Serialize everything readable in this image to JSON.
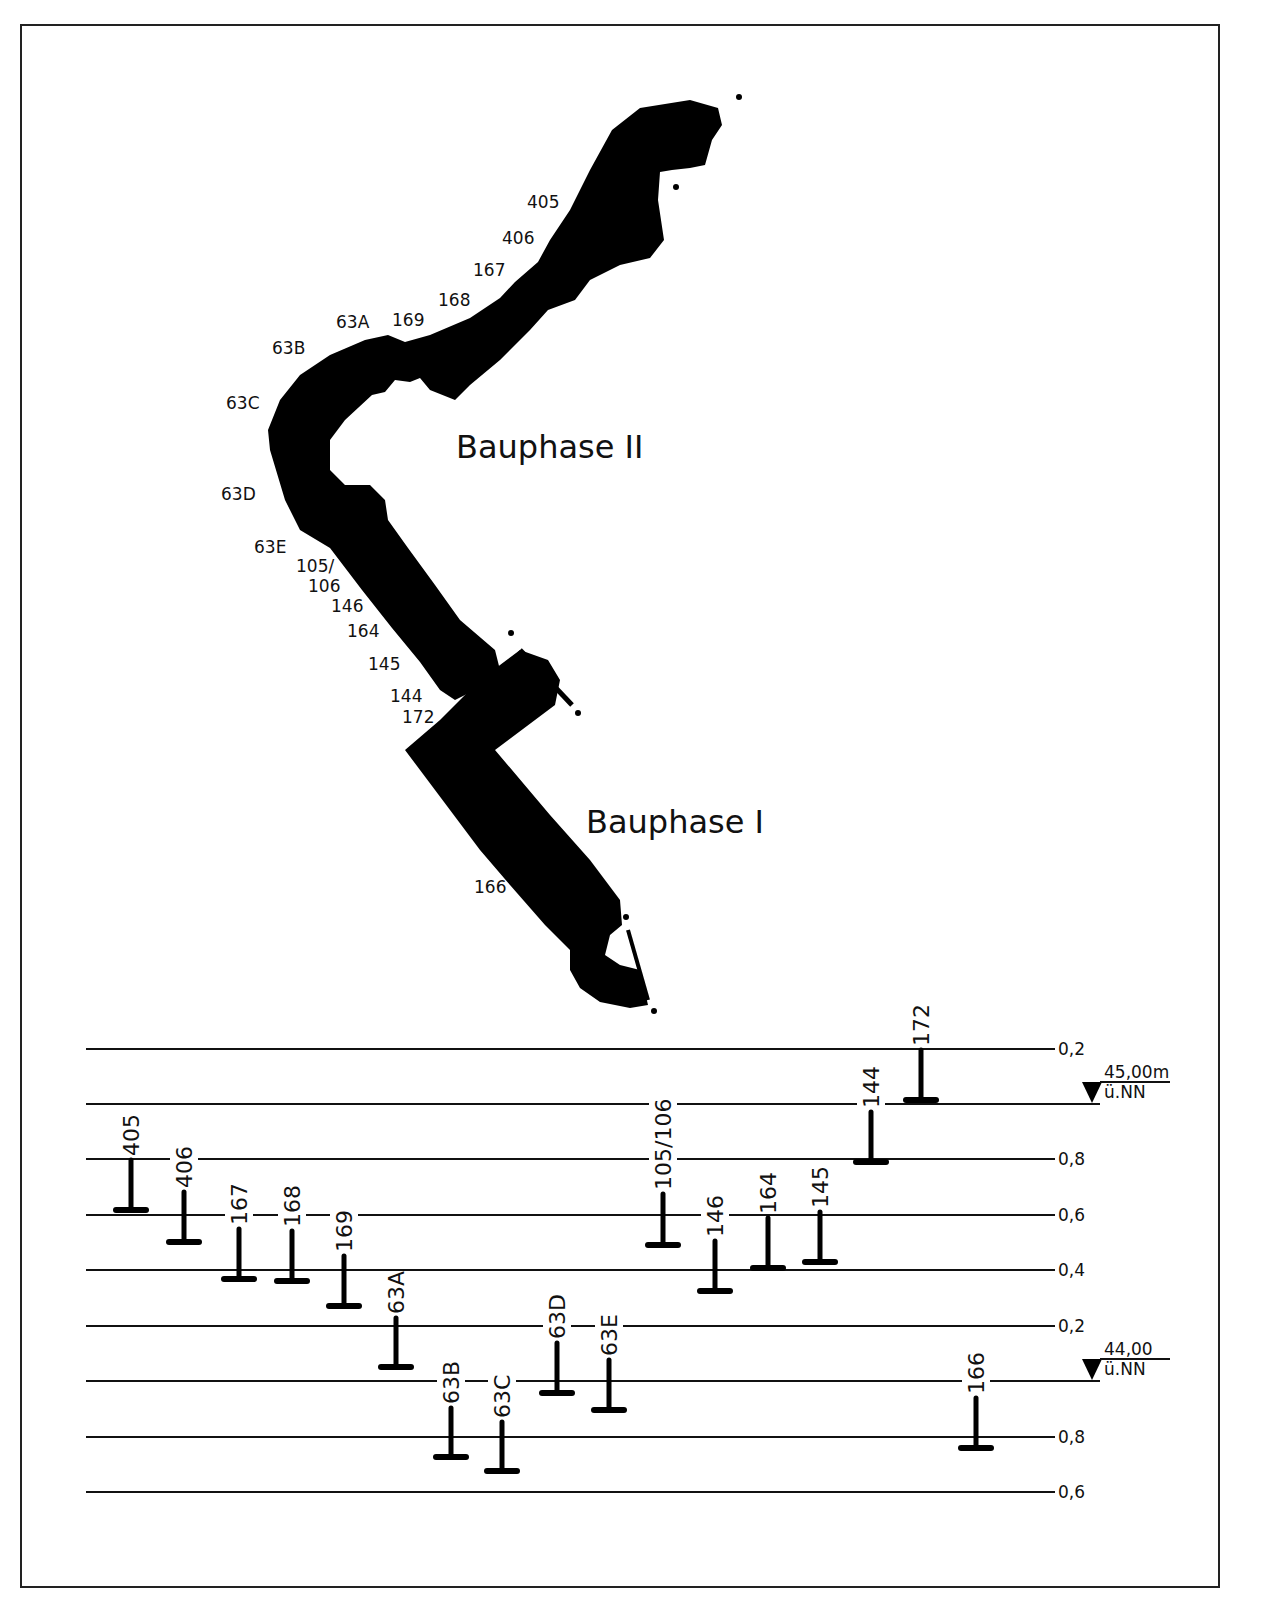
{
  "plan": {
    "phases": [
      {
        "id": "phase2",
        "label": "Bauphase II",
        "x": 456,
        "y": 458
      },
      {
        "id": "phase1",
        "label": "Bauphase I",
        "x": 586,
        "y": 833
      }
    ],
    "section_labels": [
      {
        "text": "405",
        "x": 527,
        "y": 208
      },
      {
        "text": "406",
        "x": 502,
        "y": 244
      },
      {
        "text": "167",
        "x": 473,
        "y": 276
      },
      {
        "text": "168",
        "x": 438,
        "y": 306
      },
      {
        "text": "169",
        "x": 392,
        "y": 326
      },
      {
        "text": "63A",
        "x": 336,
        "y": 328
      },
      {
        "text": "63B",
        "x": 272,
        "y": 354
      },
      {
        "text": "63C",
        "x": 226,
        "y": 409
      },
      {
        "text": "63D",
        "x": 221,
        "y": 500
      },
      {
        "text": "63E",
        "x": 254,
        "y": 553
      },
      {
        "text": "105/",
        "x": 296,
        "y": 572
      },
      {
        "text": "106",
        "x": 308,
        "y": 592
      },
      {
        "text": "146",
        "x": 331,
        "y": 612
      },
      {
        "text": "164",
        "x": 347,
        "y": 637
      },
      {
        "text": "145",
        "x": 368,
        "y": 670
      },
      {
        "text": "144",
        "x": 390,
        "y": 702
      },
      {
        "text": "172",
        "x": 402,
        "y": 723
      },
      {
        "text": "166",
        "x": 474,
        "y": 893
      }
    ]
  },
  "profile": {
    "upper_datum": {
      "value": "45,00m",
      "unit": "ü.NN",
      "y": 1104
    },
    "lower_datum": {
      "value": "44,00",
      "unit": "ü.NN",
      "y": 1381
    },
    "levels": [
      {
        "y": 1049,
        "tick": "0,2",
        "elev": 45.2
      },
      {
        "y": 1104,
        "tick": "",
        "elev": 45.0
      },
      {
        "y": 1159,
        "tick": "0,8",
        "elev": 44.8
      },
      {
        "y": 1215,
        "tick": "0,6",
        "elev": 44.6
      },
      {
        "y": 1270,
        "tick": "0,4",
        "elev": 44.4
      },
      {
        "y": 1326,
        "tick": "0,2",
        "elev": 44.2
      },
      {
        "y": 1381,
        "tick": "",
        "elev": 44.0
      },
      {
        "y": 1437,
        "tick": "0,8",
        "elev": 43.8
      },
      {
        "y": 1492,
        "tick": "0,6",
        "elev": 43.6
      }
    ]
  },
  "chart_data": {
    "type": "profile-bars",
    "ylabel": "m ü.NN",
    "datums": [
      "45,00m ü.NN",
      "44,00 ü.NN"
    ],
    "tick_labels": [
      "0,2",
      "0,8",
      "0,6",
      "0,4",
      "0,2",
      "0,8",
      "0,6"
    ],
    "categories": [
      "405",
      "406",
      "167",
      "168",
      "169",
      "63A",
      "63B",
      "63C",
      "63D",
      "63E",
      "105/106",
      "146",
      "164",
      "145",
      "144",
      "172",
      "166"
    ],
    "series": [
      {
        "name": "top_elevation_m",
        "values": [
          44.8,
          44.68,
          44.55,
          44.54,
          44.45,
          44.23,
          43.9,
          43.85,
          44.14,
          44.08,
          44.68,
          44.51,
          44.59,
          44.61,
          44.97,
          45.2,
          43.96
        ]
      },
      {
        "name": "bottom_elevation_m",
        "values": [
          44.62,
          44.5,
          44.37,
          44.36,
          44.27,
          44.05,
          43.73,
          43.67,
          43.96,
          43.9,
          44.49,
          44.33,
          44.41,
          44.43,
          44.79,
          45.01,
          43.78
        ]
      }
    ],
    "bars": [
      {
        "label": "405",
        "x": 131,
        "top": 1160,
        "bottom": 1210
      },
      {
        "label": "406",
        "x": 184,
        "top": 1192,
        "bottom": 1242
      },
      {
        "label": "167",
        "x": 239,
        "top": 1229,
        "bottom": 1279
      },
      {
        "label": "168",
        "x": 292,
        "top": 1231,
        "bottom": 1281
      },
      {
        "label": "169",
        "x": 344,
        "top": 1256,
        "bottom": 1306
      },
      {
        "label": "63A",
        "x": 396,
        "top": 1318,
        "bottom": 1367
      },
      {
        "label": "63B",
        "x": 451,
        "top": 1408,
        "bottom": 1457
      },
      {
        "label": "63C",
        "x": 502,
        "top": 1422,
        "bottom": 1471
      },
      {
        "label": "63D",
        "x": 557,
        "top": 1343,
        "bottom": 1393
      },
      {
        "label": "63E",
        "x": 609,
        "top": 1360,
        "bottom": 1410
      },
      {
        "label": "105/106",
        "x": 663,
        "top": 1194,
        "bottom": 1245
      },
      {
        "label": "146",
        "x": 715,
        "top": 1241,
        "bottom": 1291
      },
      {
        "label": "164",
        "x": 768,
        "top": 1218,
        "bottom": 1268
      },
      {
        "label": "145",
        "x": 820,
        "top": 1212,
        "bottom": 1262
      },
      {
        "label": "144",
        "x": 871,
        "top": 1112,
        "bottom": 1162
      },
      {
        "label": "172",
        "x": 921,
        "top": 1050,
        "bottom": 1100
      },
      {
        "label": "166",
        "x": 976,
        "top": 1398,
        "bottom": 1448
      }
    ],
    "grid": true
  }
}
